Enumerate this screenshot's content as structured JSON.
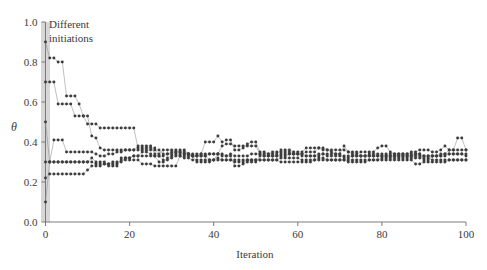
{
  "chart_data": {
    "type": "line",
    "title": "",
    "xlabel": "Iteration",
    "ylabel": "θ",
    "xlim": [
      0,
      100
    ],
    "ylim": [
      0.0,
      1.0
    ],
    "xticks": [
      0,
      20,
      40,
      60,
      80,
      100
    ],
    "yticks": [
      0.0,
      0.2,
      0.4,
      0.6,
      0.8,
      1.0
    ],
    "xticklabels": [
      "0",
      "20",
      "40",
      "60",
      "80",
      "100"
    ],
    "yticklabels": [
      "0.0",
      "0.2",
      "0.4",
      "0.6",
      "0.8",
      "1.0"
    ],
    "grid": false,
    "legend": "none",
    "marker": "dot",
    "marker_color": "#3c3c3c",
    "line_color": "#8c8c8c",
    "annotations": [
      {
        "text_line1": "Different",
        "text_line2": "initiations",
        "x": 2,
        "y": 0.96
      }
    ],
    "init_band": {
      "x": 0,
      "color": "#d7d7d7",
      "label": "Different initiations"
    },
    "initial_values": [
      0.9,
      0.7,
      0.5,
      0.3,
      0.22,
      0.1
    ],
    "converged_range": [
      0.28,
      0.38
    ],
    "series": [
      {
        "name": "init-0.90",
        "x": [
          0,
          1,
          2,
          3,
          4,
          5,
          6,
          7,
          8,
          9,
          10,
          11,
          12,
          13,
          14,
          15,
          16,
          17,
          18,
          19,
          20,
          21,
          22,
          23,
          24,
          25,
          26,
          27,
          28,
          29,
          30,
          31,
          32,
          33,
          34,
          35,
          36,
          37,
          38,
          39,
          40,
          41,
          42,
          43,
          44,
          45,
          46,
          47,
          48,
          49,
          50,
          51,
          52,
          53,
          54,
          55,
          56,
          57,
          58,
          59,
          60,
          61,
          62,
          63,
          64,
          65,
          66,
          67,
          68,
          69,
          70,
          71,
          72,
          73,
          74,
          75,
          76,
          77,
          78,
          79,
          80,
          81,
          82,
          83,
          84,
          85,
          86,
          87,
          88,
          89,
          90,
          91,
          92,
          93,
          94,
          95,
          96,
          97,
          98,
          99,
          100
        ],
        "values": [
          0.9,
          0.82,
          0.82,
          0.8,
          0.8,
          0.63,
          0.63,
          0.63,
          0.59,
          0.53,
          0.49,
          0.49,
          0.49,
          0.47,
          0.47,
          0.47,
          0.47,
          0.47,
          0.47,
          0.47,
          0.47,
          0.47,
          0.37,
          0.37,
          0.37,
          0.37,
          0.37,
          0.33,
          0.33,
          0.34,
          0.35,
          0.35,
          0.35,
          0.35,
          0.34,
          0.33,
          0.33,
          0.34,
          0.4,
          0.4,
          0.4,
          0.43,
          0.4,
          0.41,
          0.41,
          0.36,
          0.36,
          0.37,
          0.39,
          0.4,
          0.4,
          0.35,
          0.35,
          0.34,
          0.35,
          0.35,
          0.35,
          0.35,
          0.35,
          0.34,
          0.34,
          0.34,
          0.35,
          0.35,
          0.35,
          0.37,
          0.37,
          0.36,
          0.35,
          0.34,
          0.34,
          0.38,
          0.35,
          0.34,
          0.34,
          0.35,
          0.35,
          0.35,
          0.35,
          0.37,
          0.38,
          0.38,
          0.35,
          0.34,
          0.34,
          0.34,
          0.34,
          0.35,
          0.35,
          0.36,
          0.36,
          0.36,
          0.35,
          0.35,
          0.36,
          0.38,
          0.36,
          0.36,
          0.42,
          0.42,
          0.36
        ]
      },
      {
        "name": "init-0.70",
        "x": [
          0,
          1,
          2,
          3,
          4,
          5,
          6,
          7,
          8,
          9,
          10,
          11,
          12,
          13,
          14,
          15,
          16,
          17,
          18,
          19,
          20,
          21,
          22,
          23,
          24,
          25,
          26,
          27,
          28,
          29,
          30,
          31,
          32,
          33,
          34,
          35,
          36,
          37,
          38,
          39,
          40,
          41,
          42,
          43,
          44,
          45,
          46,
          47,
          48,
          49,
          50,
          51,
          52,
          53,
          54,
          55,
          56,
          57,
          58,
          59,
          60,
          61,
          62,
          63,
          64,
          65,
          66,
          67,
          68,
          69,
          70,
          71,
          72,
          73,
          74,
          75,
          76,
          77,
          78,
          79,
          80,
          81,
          82,
          83,
          84,
          85,
          86,
          87,
          88,
          89,
          90,
          91,
          92,
          93,
          94,
          95,
          96,
          97,
          98,
          99,
          100
        ],
        "values": [
          0.7,
          0.7,
          0.7,
          0.59,
          0.59,
          0.59,
          0.59,
          0.53,
          0.53,
          0.53,
          0.53,
          0.43,
          0.42,
          0.37,
          0.36,
          0.36,
          0.36,
          0.36,
          0.36,
          0.36,
          0.36,
          0.36,
          0.36,
          0.36,
          0.36,
          0.36,
          0.36,
          0.36,
          0.34,
          0.34,
          0.34,
          0.35,
          0.35,
          0.34,
          0.34,
          0.33,
          0.33,
          0.33,
          0.33,
          0.34,
          0.34,
          0.34,
          0.33,
          0.33,
          0.34,
          0.33,
          0.33,
          0.33,
          0.33,
          0.34,
          0.34,
          0.34,
          0.33,
          0.33,
          0.33,
          0.33,
          0.34,
          0.34,
          0.34,
          0.34,
          0.34,
          0.33,
          0.33,
          0.33,
          0.33,
          0.34,
          0.34,
          0.33,
          0.33,
          0.33,
          0.33,
          0.33,
          0.33,
          0.33,
          0.33,
          0.33,
          0.33,
          0.33,
          0.33,
          0.33,
          0.33,
          0.33,
          0.33,
          0.33,
          0.33,
          0.33,
          0.33,
          0.33,
          0.33,
          0.33,
          0.33,
          0.33,
          0.33,
          0.33,
          0.33,
          0.33,
          0.34,
          0.34,
          0.34,
          0.34,
          0.33
        ]
      },
      {
        "name": "init-0.50",
        "x": [
          0,
          1,
          2,
          3,
          4,
          5,
          6,
          7,
          8,
          9,
          10,
          11,
          12,
          13,
          14,
          15,
          16,
          17,
          18,
          19,
          20,
          21,
          22,
          23,
          24,
          25,
          26,
          27,
          28,
          29,
          30,
          31,
          32,
          33,
          34,
          35,
          36,
          37,
          38,
          39,
          40,
          41,
          42,
          43,
          44,
          45,
          46,
          47,
          48,
          49,
          50,
          51,
          52,
          53,
          54,
          55,
          56,
          57,
          58,
          59,
          60,
          61,
          62,
          63,
          64,
          65,
          66,
          67,
          68,
          69,
          70,
          71,
          72,
          73,
          74,
          75,
          76,
          77,
          78,
          79,
          80,
          81,
          82,
          83,
          84,
          85,
          86,
          87,
          88,
          89,
          90,
          91,
          92,
          93,
          94,
          95,
          96,
          97,
          98,
          99,
          100
        ],
        "values": [
          0.5,
          0.3,
          0.3,
          0.3,
          0.3,
          0.3,
          0.3,
          0.3,
          0.3,
          0.3,
          0.3,
          0.3,
          0.29,
          0.29,
          0.29,
          0.29,
          0.3,
          0.3,
          0.3,
          0.32,
          0.32,
          0.33,
          0.33,
          0.33,
          0.33,
          0.33,
          0.33,
          0.33,
          0.31,
          0.31,
          0.32,
          0.33,
          0.33,
          0.32,
          0.32,
          0.31,
          0.31,
          0.31,
          0.31,
          0.31,
          0.31,
          0.32,
          0.31,
          0.31,
          0.31,
          0.31,
          0.31,
          0.31,
          0.31,
          0.31,
          0.31,
          0.31,
          0.31,
          0.31,
          0.31,
          0.31,
          0.32,
          0.32,
          0.32,
          0.32,
          0.32,
          0.31,
          0.31,
          0.31,
          0.31,
          0.32,
          0.32,
          0.31,
          0.31,
          0.31,
          0.31,
          0.31,
          0.31,
          0.31,
          0.31,
          0.31,
          0.31,
          0.31,
          0.31,
          0.31,
          0.32,
          0.32,
          0.32,
          0.32,
          0.32,
          0.32,
          0.32,
          0.32,
          0.32,
          0.32,
          0.32,
          0.32,
          0.31,
          0.31,
          0.31,
          0.31,
          0.31,
          0.31,
          0.31,
          0.31,
          0.31
        ]
      },
      {
        "name": "init-0.30",
        "x": [
          0,
          1,
          2,
          3,
          4,
          5,
          6,
          7,
          8,
          9,
          10,
          11,
          12,
          13,
          14,
          15,
          16,
          17,
          18,
          19,
          20,
          21,
          22,
          23,
          24,
          25,
          26,
          27,
          28,
          29,
          30,
          31,
          32,
          33,
          34,
          35,
          36,
          37,
          38,
          39,
          40,
          41,
          42,
          43,
          44,
          45,
          46,
          47,
          48,
          49,
          50,
          51,
          52,
          53,
          54,
          55,
          56,
          57,
          58,
          59,
          60,
          61,
          62,
          63,
          64,
          65,
          66,
          67,
          68,
          69,
          70,
          71,
          72,
          73,
          74,
          75,
          76,
          77,
          78,
          79,
          80,
          81,
          82,
          83,
          84,
          85,
          86,
          87,
          88,
          89,
          90,
          91,
          92,
          93,
          94,
          95,
          96,
          97,
          98,
          99,
          100
        ],
        "values": [
          0.3,
          0.3,
          0.41,
          0.41,
          0.41,
          0.35,
          0.35,
          0.35,
          0.35,
          0.35,
          0.35,
          0.35,
          0.34,
          0.33,
          0.33,
          0.34,
          0.34,
          0.35,
          0.35,
          0.36,
          0.36,
          0.36,
          0.38,
          0.38,
          0.38,
          0.38,
          0.34,
          0.34,
          0.36,
          0.36,
          0.36,
          0.36,
          0.36,
          0.36,
          0.34,
          0.34,
          0.34,
          0.34,
          0.34,
          0.34,
          0.34,
          0.34,
          0.38,
          0.39,
          0.39,
          0.38,
          0.38,
          0.38,
          0.38,
          0.38,
          0.38,
          0.34,
          0.34,
          0.34,
          0.34,
          0.34,
          0.36,
          0.36,
          0.36,
          0.35,
          0.35,
          0.35,
          0.37,
          0.37,
          0.37,
          0.37,
          0.36,
          0.36,
          0.36,
          0.36,
          0.36,
          0.36,
          0.35,
          0.35,
          0.35,
          0.33,
          0.33,
          0.34,
          0.34,
          0.34,
          0.34,
          0.34,
          0.34,
          0.34,
          0.34,
          0.34,
          0.34,
          0.34,
          0.34,
          0.34,
          0.31,
          0.31,
          0.33,
          0.33,
          0.34,
          0.34,
          0.36,
          0.36,
          0.36,
          0.36,
          0.36
        ]
      },
      {
        "name": "init-0.22",
        "x": [
          0,
          1,
          2,
          3,
          4,
          5,
          6,
          7,
          8,
          9,
          10,
          11,
          12,
          13,
          14,
          15,
          16,
          17,
          18,
          19,
          20,
          21,
          22,
          23,
          24,
          25,
          26,
          27,
          28,
          29,
          30,
          31,
          32,
          33,
          34,
          35,
          36,
          37,
          38,
          39,
          40,
          41,
          42,
          43,
          44,
          45,
          46,
          47,
          48,
          49,
          50,
          51,
          52,
          53,
          54,
          55,
          56,
          57,
          58,
          59,
          60,
          61,
          62,
          63,
          64,
          65,
          66,
          67,
          68,
          69,
          70,
          71,
          72,
          73,
          74,
          75,
          76,
          77,
          78,
          79,
          80,
          81,
          82,
          83,
          84,
          85,
          86,
          87,
          88,
          89,
          90,
          91,
          92,
          93,
          94,
          95,
          96,
          97,
          98,
          99,
          100
        ],
        "values": [
          0.22,
          0.24,
          0.24,
          0.24,
          0.24,
          0.24,
          0.24,
          0.24,
          0.24,
          0.24,
          0.26,
          0.28,
          0.28,
          0.28,
          0.29,
          0.29,
          0.29,
          0.29,
          0.31,
          0.31,
          0.31,
          0.31,
          0.31,
          0.29,
          0.29,
          0.29,
          0.28,
          0.28,
          0.28,
          0.28,
          0.28,
          0.28,
          0.33,
          0.33,
          0.33,
          0.33,
          0.3,
          0.3,
          0.3,
          0.3,
          0.31,
          0.31,
          0.31,
          0.31,
          0.31,
          0.3,
          0.3,
          0.3,
          0.31,
          0.31,
          0.31,
          0.31,
          0.31,
          0.31,
          0.31,
          0.31,
          0.3,
          0.3,
          0.3,
          0.3,
          0.3,
          0.3,
          0.3,
          0.3,
          0.31,
          0.31,
          0.31,
          0.31,
          0.31,
          0.31,
          0.31,
          0.31,
          0.3,
          0.3,
          0.3,
          0.3,
          0.3,
          0.31,
          0.31,
          0.31,
          0.31,
          0.31,
          0.31,
          0.31,
          0.31,
          0.31,
          0.31,
          0.31,
          0.29,
          0.29,
          0.3,
          0.3,
          0.3,
          0.3,
          0.3,
          0.3,
          0.31,
          0.31,
          0.31,
          0.31,
          0.31
        ]
      },
      {
        "name": "init-0.10",
        "x": [
          0,
          1,
          2,
          3,
          4,
          5,
          6,
          7,
          8,
          9,
          10,
          11,
          12,
          13,
          14,
          15,
          16,
          17,
          18,
          19,
          20,
          21,
          22,
          23,
          24,
          25,
          26,
          27,
          28,
          29,
          30,
          31,
          32,
          33,
          34,
          35,
          36,
          37,
          38,
          39,
          40,
          41,
          42,
          43,
          44,
          45,
          46,
          47,
          48,
          49,
          50,
          51,
          52,
          53,
          54,
          55,
          56,
          57,
          58,
          59,
          60,
          61,
          62,
          63,
          64,
          65,
          66,
          67,
          68,
          69,
          70,
          71,
          72,
          73,
          74,
          75,
          76,
          77,
          78,
          79,
          80,
          81,
          82,
          83,
          84,
          85,
          86,
          87,
          88,
          89,
          90,
          91,
          92,
          93,
          94,
          95,
          96,
          97,
          98,
          99,
          100
        ],
        "values": [
          0.1,
          0.3,
          0.3,
          0.3,
          0.3,
          0.3,
          0.3,
          0.3,
          0.3,
          0.3,
          0.3,
          0.32,
          0.3,
          0.3,
          0.3,
          0.28,
          0.28,
          0.28,
          0.32,
          0.32,
          0.32,
          0.33,
          0.33,
          0.35,
          0.35,
          0.34,
          0.33,
          0.3,
          0.3,
          0.32,
          0.33,
          0.34,
          0.34,
          0.34,
          0.34,
          0.33,
          0.33,
          0.33,
          0.33,
          0.31,
          0.31,
          0.34,
          0.34,
          0.33,
          0.33,
          0.28,
          0.28,
          0.29,
          0.3,
          0.3,
          0.3,
          0.33,
          0.33,
          0.33,
          0.33,
          0.33,
          0.33,
          0.33,
          0.34,
          0.34,
          0.34,
          0.34,
          0.33,
          0.33,
          0.33,
          0.33,
          0.34,
          0.34,
          0.34,
          0.34,
          0.34,
          0.32,
          0.32,
          0.33,
          0.33,
          0.33,
          0.33,
          0.33,
          0.33,
          0.33,
          0.33,
          0.33,
          0.33,
          0.33,
          0.33,
          0.33,
          0.33,
          0.33,
          0.34,
          0.34,
          0.33,
          0.33,
          0.33,
          0.33,
          0.33,
          0.34,
          0.34,
          0.34,
          0.34,
          0.34,
          0.34
        ]
      }
    ]
  },
  "axes": {
    "y_label": "θ",
    "x_label": "Iteration"
  },
  "annotation": {
    "line1": "Different",
    "line2": "initiations"
  }
}
